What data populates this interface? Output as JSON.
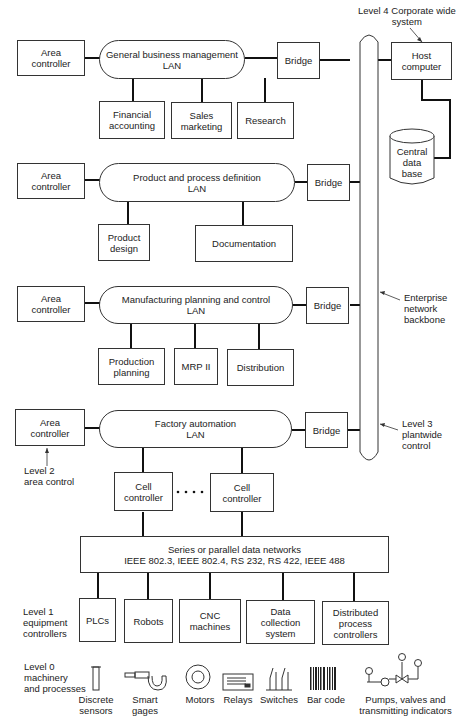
{
  "level4": {
    "label": "Level 4 Corporate wide\nsystem",
    "host": "Host\ncomputer",
    "database": "Central\ndata\nbase"
  },
  "backbone": {
    "label": "Enterprise\nnetwork\nbackbone"
  },
  "level3": {
    "label": "Level 3\nplantwide\ncontrol"
  },
  "level2": {
    "label": "Level 2\narea control"
  },
  "level1": {
    "label": "Level 1\nequipment\ncontrollers"
  },
  "level0": {
    "label": "Level 0\nmachinery\nand processes"
  },
  "lans": [
    {
      "area": "Area\ncontroller",
      "name": "General business management\nLAN",
      "bridge": "Bridge",
      "nodes": [
        "Financial\naccounting",
        "Sales\nmarketing",
        "Research"
      ]
    },
    {
      "area": "Area\ncontroller",
      "name": "Product and process definition\nLAN",
      "bridge": "Bridge",
      "nodes": [
        "Product\ndesign",
        "Documentation"
      ]
    },
    {
      "area": "Area\ncontroller",
      "name": "Manufacturing planning and control\nLAN",
      "bridge": "Bridge",
      "nodes": [
        "Production\nplanning",
        "MRP II",
        "Distribution"
      ]
    },
    {
      "area": "Area\ncontroller",
      "name": "Factory automation\nLAN",
      "bridge": "Bridge",
      "nodes": [
        "Cell\ncontroller",
        "Cell\ncontroller"
      ],
      "ellipsis": "· · · ·"
    }
  ],
  "data_network": {
    "label": "Series or parallel data networks\nIEEE 802.3, IEEE 802.4, RS 232, RS 422, IEEE 488"
  },
  "equipment": [
    "PLCs",
    "Robots",
    "CNC\nmachines",
    "Data\ncollection\nsystem",
    "Distributed\nprocess\ncontrollers"
  ],
  "devices": [
    {
      "icon": "discrete-sensor-icon",
      "label": "Discrete\nsensors"
    },
    {
      "icon": "smart-gage-icon",
      "label": "Smart\ngages"
    },
    {
      "icon": "motor-icon",
      "label": "Motors"
    },
    {
      "icon": "relay-icon",
      "label": "Relays"
    },
    {
      "icon": "switch-icon",
      "label": "Switches"
    },
    {
      "icon": "bar-code-icon",
      "label": "Bar code"
    },
    {
      "icon": "pump-valve-icon",
      "label": "Pumps, valves and\ntransmitting indicators"
    }
  ]
}
